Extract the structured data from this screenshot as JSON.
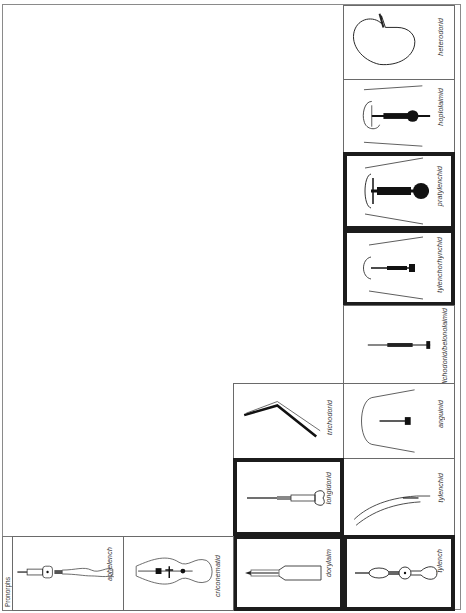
{
  "figure": {
    "title": "Pronorphs",
    "orientation": "rotated 90° counter-clockwise",
    "colors": {
      "thin_border": "#6a6a6a",
      "thick_border": "#1c1c1c",
      "ink": "#222222"
    }
  },
  "panels": [
    {
      "id": "heterodorid",
      "label": "heterodorid",
      "highlighted": false,
      "icon": "round-sac-stylet"
    },
    {
      "id": "hoplolaimid",
      "label": "hoplolaimid",
      "highlighted": false,
      "icon": "head-stylet-heavy"
    },
    {
      "id": "pratylenchid",
      "label": "pratylenchid",
      "highlighted": true,
      "icon": "head-stylet-bold"
    },
    {
      "id": "tylenchorhynchid",
      "label": "tylenchorhynchid",
      "highlighted": true,
      "icon": "head-stylet-fine"
    },
    {
      "id": "dolichodorid",
      "label": "dolichodorid/belonolaimid",
      "highlighted": false,
      "icon": "long-stylet"
    },
    {
      "id": "anguinid",
      "label": "anguinid",
      "highlighted": false,
      "icon": "head-stylet-small"
    },
    {
      "id": "tylenchid",
      "label": "tylenchid",
      "highlighted": false,
      "icon": "curved-body"
    },
    {
      "id": "tylench",
      "label": "tylench",
      "highlighted": true,
      "icon": "oesophagus-bulb"
    },
    {
      "id": "trichodorid",
      "label": "trichodorid",
      "highlighted": false,
      "icon": "bent-onchiostyle"
    },
    {
      "id": "longidorid",
      "label": "longidorid",
      "highlighted": true,
      "icon": "odontostyle"
    },
    {
      "id": "dorylaim",
      "label": "dorylaim",
      "highlighted": true,
      "icon": "dorylaim-oesophagus"
    },
    {
      "id": "criconematid",
      "label": "criconematid",
      "highlighted": false,
      "icon": "crico-oesophagus"
    },
    {
      "id": "aphelench",
      "label": "aphelench",
      "highlighted": false,
      "icon": "aphelench-oesophagus"
    }
  ]
}
